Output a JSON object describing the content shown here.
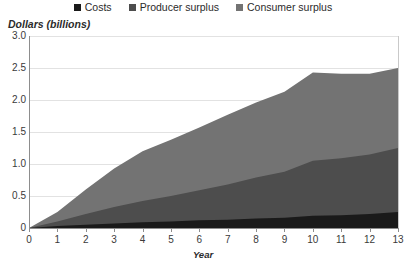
{
  "chart_data": {
    "type": "area",
    "stacked": true,
    "title": "",
    "subtitle": "",
    "xlabel": "Year",
    "ylabel": "Dollars (billions)",
    "x": [
      0,
      1,
      2,
      3,
      4,
      5,
      6,
      7,
      8,
      9,
      10,
      11,
      12,
      13
    ],
    "xlim": [
      0,
      13
    ],
    "ylim": [
      0,
      3.0
    ],
    "ytick_labels": [
      "0",
      "0.5",
      "1.0",
      "1.5",
      "2.0",
      "2.5",
      "3.0"
    ],
    "ytick_values": [
      0,
      0.5,
      1.0,
      1.5,
      2.0,
      2.5,
      3.0
    ],
    "xtick_labels": [
      "0",
      "1",
      "2",
      "3",
      "4",
      "5",
      "6",
      "7",
      "8",
      "9",
      "10",
      "11",
      "12",
      "13"
    ],
    "grid": true,
    "grid_axis": "y",
    "legend_position": "top",
    "series": [
      {
        "name": "Costs",
        "color": "#1a1a1a",
        "values": [
          0.0,
          0.03,
          0.05,
          0.07,
          0.09,
          0.1,
          0.12,
          0.13,
          0.15,
          0.16,
          0.19,
          0.2,
          0.22,
          0.25
        ]
      },
      {
        "name": "Producer surplus",
        "color": "#4d4d4d",
        "values": [
          0.0,
          0.07,
          0.17,
          0.26,
          0.33,
          0.4,
          0.47,
          0.55,
          0.64,
          0.72,
          0.86,
          0.89,
          0.93,
          1.0
        ]
      },
      {
        "name": "Consumer surplus",
        "color": "#737373",
        "values": [
          0.0,
          0.15,
          0.38,
          0.6,
          0.78,
          0.88,
          0.98,
          1.09,
          1.17,
          1.25,
          1.38,
          1.32,
          1.26,
          1.25
        ]
      }
    ],
    "cumulative_totals": [
      0.0,
      0.25,
      0.6,
      0.93,
      1.2,
      1.38,
      1.57,
      1.77,
      1.96,
      2.13,
      2.43,
      2.41,
      2.41,
      2.5
    ]
  },
  "legend": {
    "items": [
      {
        "label": "Costs",
        "color": "#1a1a1a"
      },
      {
        "label": "Producer surplus",
        "color": "#4d4d4d"
      },
      {
        "label": "Consumer surplus",
        "color": "#737373"
      }
    ]
  },
  "axes": {
    "y_title": "Dollars (billions)",
    "x_title": "Year"
  }
}
